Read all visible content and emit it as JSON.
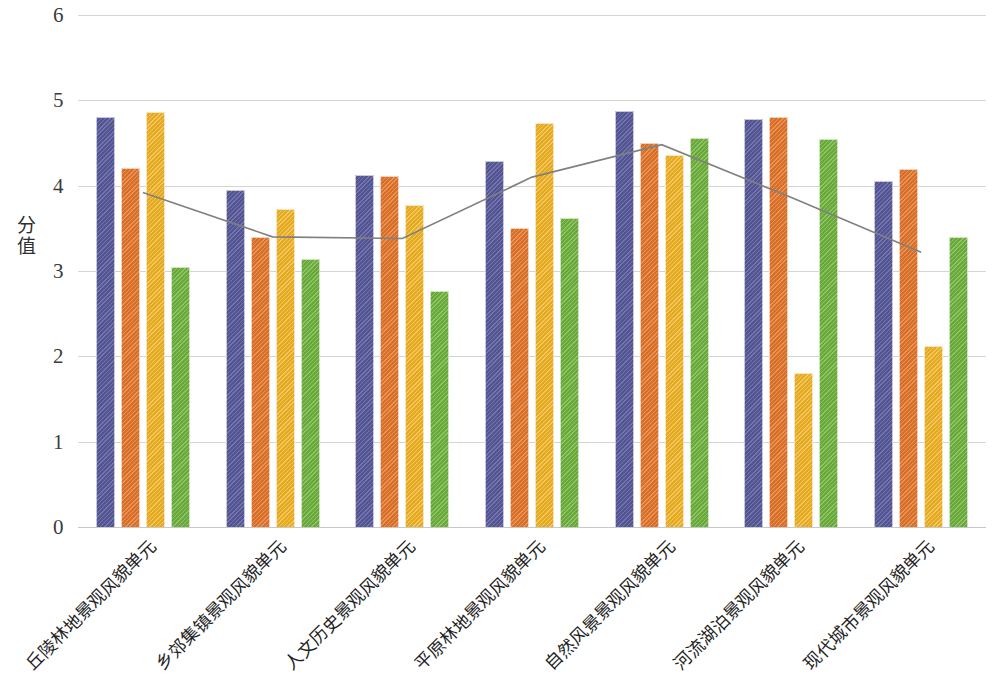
{
  "chart_data": {
    "type": "bar",
    "title": "",
    "xlabel": "",
    "ylabel": "分值",
    "ylim": [
      0,
      6
    ],
    "ytick_labels": [
      "0",
      "1",
      "2",
      "3",
      "4",
      "5",
      "6"
    ],
    "yticks": [
      0,
      1,
      2,
      3,
      4,
      5,
      6
    ],
    "grid": true,
    "legend": "none",
    "categories": [
      "丘陵林地景观风貌单元",
      "乡郊集镇景观风貌单元",
      "人文历史景观风貌单元",
      "平原林地景观风貌单元",
      "自然风景景观风貌单元",
      "河流湖泊景观风貌单元",
      "现代城市景观风貌单元"
    ],
    "series": [
      {
        "name": "系列1",
        "color": "#585a9c",
        "type": "bar",
        "values": [
          4.8,
          3.95,
          4.12,
          4.29,
          4.87,
          4.78,
          4.05
        ]
      },
      {
        "name": "系列2",
        "color": "#e4752a",
        "type": "bar",
        "values": [
          4.21,
          3.4,
          4.11,
          3.5,
          4.5,
          4.8,
          4.19
        ]
      },
      {
        "name": "系列3",
        "color": "#efb324",
        "type": "bar",
        "values": [
          4.86,
          3.73,
          3.77,
          4.73,
          4.36,
          1.8,
          2.12
        ]
      },
      {
        "name": "系列4",
        "color": "#6fb23c",
        "type": "bar",
        "values": [
          3.05,
          3.14,
          2.76,
          3.62,
          4.56,
          4.55,
          3.4
        ]
      },
      {
        "name": "平均值",
        "color": "#808080",
        "type": "line",
        "values": [
          3.92,
          3.4,
          3.38,
          4.1,
          4.48,
          3.86,
          3.22
        ]
      }
    ]
  },
  "colors": {
    "series_1": "#585a9c",
    "series_2": "#e4752a",
    "series_3": "#efb324",
    "series_4": "#6fb23c",
    "trend_line": "#808080",
    "gridline": "#d4d4d4",
    "background": "#ffffff",
    "text": "#2e2e2e"
  }
}
